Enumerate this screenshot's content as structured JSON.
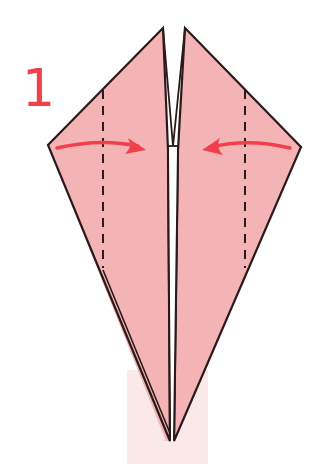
{
  "diagram": {
    "step_number": "1",
    "colors": {
      "paper_fill": "#f4b4b6",
      "outline": "#2a1a1a",
      "arrow": "#f0404a",
      "step_number": "#f0404a",
      "background_strip": "#fbe9ea"
    },
    "folds": [
      {
        "name": "left-flap-valley-fold",
        "type": "valley-fold-dashed",
        "direction": "right"
      },
      {
        "name": "right-flap-valley-fold",
        "type": "valley-fold-dashed",
        "direction": "left"
      }
    ],
    "arrows": [
      {
        "name": "left-fold-arrow",
        "points": "toward center"
      },
      {
        "name": "right-fold-arrow",
        "points": "toward center"
      }
    ]
  }
}
